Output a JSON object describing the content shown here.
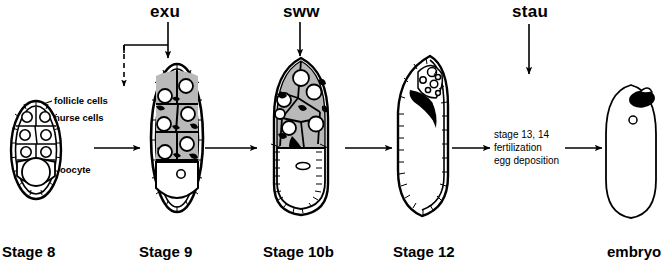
{
  "diagram": {
    "title_text": "Drosophila oogenesis stages",
    "genes": [
      {
        "id": "exu",
        "label": "exu"
      },
      {
        "id": "sww",
        "label": "sww"
      },
      {
        "id": "stau",
        "label": "stau"
      }
    ],
    "stages": [
      {
        "id": "stage8",
        "label": "Stage 8"
      },
      {
        "id": "stage9",
        "label": "Stage 9"
      },
      {
        "id": "stage10b",
        "label": "Stage 10b"
      },
      {
        "id": "stage12",
        "label": "Stage 12"
      },
      {
        "id": "embryo",
        "label": "embryo"
      }
    ],
    "annotations": [
      {
        "id": "follicle-cells",
        "label": "follicle cells"
      },
      {
        "id": "nurse-cells",
        "label": "nurse cells"
      },
      {
        "id": "oocyte",
        "label": "oocyte"
      }
    ],
    "process_note": {
      "line1": "stage 13, 14",
      "line2": "fertilization",
      "line3": "egg deposition"
    },
    "colors": {
      "ink": "#000000",
      "background": "#ffffff",
      "cytoplasm_shade": "#b9b9b9",
      "dark_fill": "#000000"
    }
  }
}
